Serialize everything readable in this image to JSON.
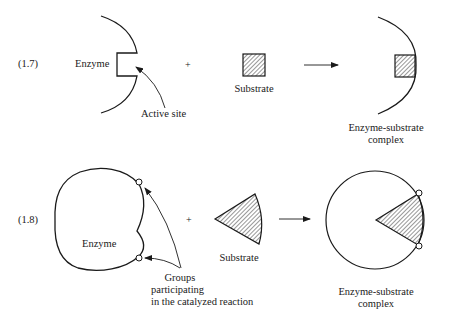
{
  "reaction_1_7": {
    "equation_label": "(1.7)",
    "enzyme_label": "Enzyme",
    "active_site_label": "Active site",
    "plus": "+",
    "substrate_label": "Substrate",
    "complex_label_line1": "Enzyme-substrate",
    "complex_label_line2": "complex",
    "substrate_shape": "hatched-square",
    "enzyme_shape": "arc-with-square-notch"
  },
  "reaction_1_8": {
    "equation_label": "(1.8)",
    "enzyme_label": "Enzyme",
    "plus": "+",
    "substrate_label": "Substrate",
    "groups_label_line1": "Groups",
    "groups_label_line2": "participating",
    "groups_label_line3": "in the catalyzed reaction",
    "complex_label_line1": "Enzyme-substrate",
    "complex_label_line2": "complex",
    "substrate_shape": "hatched-wedge",
    "enzyme_shape": "lobed-circle-with-two-groups"
  },
  "colors": {
    "stroke": "#1a1a1a",
    "background": "#ffffff"
  }
}
